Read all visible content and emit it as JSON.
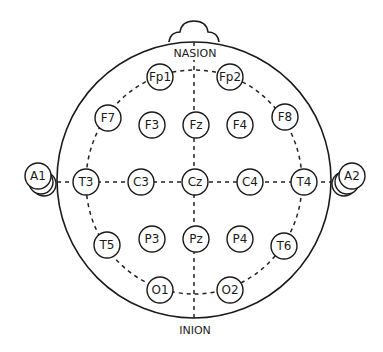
{
  "diagram": {
    "landmarks": {
      "top": "NASION",
      "bottom": "INION"
    },
    "electrodes": [
      {
        "id": "Fp1",
        "label": "Fp1"
      },
      {
        "id": "Fp2",
        "label": "Fp2"
      },
      {
        "id": "F7",
        "label": "F7"
      },
      {
        "id": "F3",
        "label": "F3"
      },
      {
        "id": "Fz",
        "label": "Fz"
      },
      {
        "id": "F4",
        "label": "F4"
      },
      {
        "id": "F8",
        "label": "F8"
      },
      {
        "id": "A1",
        "label": "A1"
      },
      {
        "id": "T3",
        "label": "T3"
      },
      {
        "id": "C3",
        "label": "C3"
      },
      {
        "id": "Cz",
        "label": "Cz"
      },
      {
        "id": "C4",
        "label": "C4"
      },
      {
        "id": "T4",
        "label": "T4"
      },
      {
        "id": "A2",
        "label": "A2"
      },
      {
        "id": "T5",
        "label": "T5"
      },
      {
        "id": "P3",
        "label": "P3"
      },
      {
        "id": "Pz",
        "label": "Pz"
      },
      {
        "id": "P4",
        "label": "P4"
      },
      {
        "id": "T6",
        "label": "T6"
      },
      {
        "id": "O1",
        "label": "O1"
      },
      {
        "id": "O2",
        "label": "O2"
      }
    ]
  }
}
